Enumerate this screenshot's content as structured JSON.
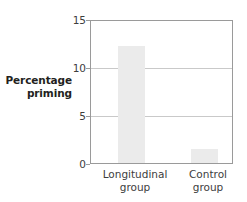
{
  "chart_data": {
    "type": "bar",
    "title": "",
    "subtitle": "",
    "xlabel": "",
    "ylabel": "Percentage priming",
    "ylabel_line1": "Percentage",
    "ylabel_line2": "priming",
    "categories": [
      "Longitudinal group",
      "Control group"
    ],
    "category_lines": [
      {
        "line1": "Longitudinal",
        "line2": "group"
      },
      {
        "line1": "Control",
        "line2": "group"
      }
    ],
    "values": [
      12.4,
      1.5
    ],
    "ylim": [
      0,
      15
    ],
    "yticks": [
      0,
      5,
      10,
      15
    ],
    "ytick_labels": [
      "0",
      "5",
      "10",
      "15"
    ],
    "grid": true,
    "gridlines_at": [
      5,
      10
    ],
    "legend": null,
    "legend_position": "none",
    "annotations": [],
    "colors": {
      "bar_fill": "#ebebeb",
      "frame": "#9a9a9a",
      "gridline": "#c9c9c9",
      "text": "#3d3d3d",
      "title_text": "#231f20",
      "background": "#ffffff"
    }
  }
}
